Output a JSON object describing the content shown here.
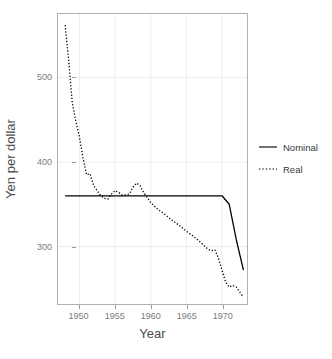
{
  "chart_data": {
    "type": "line",
    "title": "",
    "xlabel": "Year",
    "ylabel": "Yen per dollar",
    "xlim": [
      1947.0,
      1973.5
    ],
    "ylim": [
      232,
      575
    ],
    "xticks": [
      1950,
      1955,
      1960,
      1965,
      1970
    ],
    "xticklabels": [
      "1950",
      "1955",
      "1960",
      "1965",
      "1970"
    ],
    "yticks": [
      300,
      400,
      500
    ],
    "yticklabels": [
      "300",
      "400",
      "500"
    ],
    "grid": true,
    "legend_position": "right",
    "series": [
      {
        "name": "Nominal",
        "linestyle": "solid",
        "color": "#000000",
        "x": [
          1948,
          1949,
          1950,
          1951,
          1952,
          1953,
          1954,
          1955,
          1956,
          1957,
          1958,
          1959,
          1960,
          1961,
          1962,
          1963,
          1964,
          1965,
          1966,
          1967,
          1968,
          1969,
          1970,
          1971,
          1972,
          1973
        ],
        "values": [
          360,
          360,
          360,
          360,
          360,
          360,
          360,
          360,
          360,
          360,
          360,
          360,
          360,
          360,
          360,
          360,
          360,
          360,
          360,
          360,
          360,
          360,
          360,
          350,
          308,
          272
        ]
      },
      {
        "name": "Real",
        "linestyle": "dotted",
        "color": "#000000",
        "x": [
          1948,
          1948.5,
          1949,
          1949.5,
          1950,
          1950.5,
          1951,
          1951.5,
          1952,
          1952.5,
          1953,
          1953.5,
          1954,
          1954.5,
          1955,
          1955.5,
          1956,
          1956.5,
          1957,
          1957.5,
          1958,
          1958.5,
          1959,
          1959.5,
          1960,
          1961,
          1962,
          1963,
          1964,
          1965,
          1966,
          1967,
          1968,
          1968.5,
          1969,
          1969.5,
          1970,
          1970.5,
          1971,
          1971.5,
          1972,
          1972.5,
          1973
        ],
        "values": [
          562,
          520,
          470,
          448,
          430,
          405,
          385,
          386,
          372,
          366,
          360,
          357,
          356,
          362,
          366,
          364,
          361,
          361,
          362,
          370,
          375,
          372,
          364,
          358,
          352,
          344,
          338,
          331,
          325,
          318,
          312,
          305,
          297,
          295,
          296,
          286,
          272,
          258,
          252,
          254,
          252,
          246,
          240
        ]
      }
    ],
    "annotations": []
  },
  "legend": {
    "items": [
      {
        "label": "Nominal",
        "style": "solid"
      },
      {
        "label": "Real",
        "style": "dotted"
      }
    ]
  },
  "axes": {
    "x_title": "Year",
    "y_title": "Yen per dollar"
  }
}
